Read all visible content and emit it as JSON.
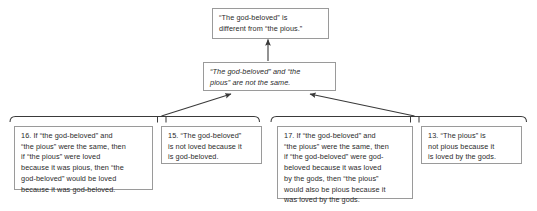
{
  "diagram": {
    "type": "argument-map",
    "background_color": "#ffffff",
    "border_color": "#9a9a9a",
    "text_color": "#2b2b2b",
    "connector_color": "#3a3a3a",
    "nodes": [
      {
        "id": "conclusion",
        "role": "conclusion",
        "text": "“The god-beloved” is\ndifferent from “the pious.”",
        "style": "normal"
      },
      {
        "id": "intermediate",
        "role": "intermediate-conclusion",
        "text": "“The god-beloved” and “the\npious” are not the same.",
        "style": "italic"
      },
      {
        "id": "premise-16",
        "role": "premise",
        "number": "16.",
        "text": "16. If “the god-beloved” and\n“the pious” were the same, then\nif “the pious” were loved\nbecause it was pious, then “the\ngod-beloved” would be loved\nbecause it was god-beloved.",
        "style": "normal"
      },
      {
        "id": "premise-15",
        "role": "premise",
        "number": "15.",
        "text": "15. “The god-beloved”\nis not loved because it\nis god-beloved.",
        "style": "normal"
      },
      {
        "id": "premise-17",
        "role": "premise",
        "number": "17.",
        "text": "17. If “the god-beloved” and\n“the pious” were the same, then\nif “the god-beloved” were god-\nbeloved because it was loved\nby the gods, then “the pious”\nwould also be pious because it\nwas loved by the gods.",
        "style": "normal"
      },
      {
        "id": "premise-13",
        "role": "premise",
        "number": "13.",
        "text": "13. “The pious” is\nnot pious because it\nis loved by the gods.",
        "style": "normal"
      }
    ],
    "connectors": [
      {
        "id": "arrow-intermediate-to-conclusion",
        "kind": "vertical-arrow",
        "from": "intermediate",
        "to": "conclusion"
      },
      {
        "id": "arrow-left-group-to-intermediate",
        "kind": "diagonal-arrow",
        "from": "group-left",
        "to": "intermediate"
      },
      {
        "id": "arrow-right-group-to-intermediate",
        "kind": "diagonal-arrow",
        "from": "group-right",
        "to": "intermediate"
      }
    ],
    "groups": [
      {
        "id": "group-left",
        "kind": "co-premise-bracket",
        "members": [
          "premise-16",
          "premise-15"
        ]
      },
      {
        "id": "group-right",
        "kind": "co-premise-bracket",
        "members": [
          "premise-17",
          "premise-13"
        ]
      }
    ]
  }
}
